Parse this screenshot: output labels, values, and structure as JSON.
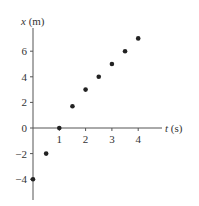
{
  "chart_data": {
    "type": "scatter",
    "title": "",
    "xlabel_var": "t",
    "xlabel_unit": "(s)",
    "ylabel_var": "x",
    "ylabel_unit": "(m)",
    "x_ticks": [
      "1",
      "2",
      "3",
      "4"
    ],
    "y_ticks": [
      "6",
      "4",
      "2",
      "0",
      "−2",
      "−4"
    ],
    "xlim": [
      0,
      5
    ],
    "ylim": [
      -5.5,
      7.5
    ],
    "grid": false,
    "legend": null,
    "points": [
      {
        "t": 0,
        "x": -4
      },
      {
        "t": 0.5,
        "x": -2
      },
      {
        "t": 1,
        "x": 0
      },
      {
        "t": 1.5,
        "x": 1.7
      },
      {
        "t": 2,
        "x": 3
      },
      {
        "t": 2.5,
        "x": 4
      },
      {
        "t": 3,
        "x": 5
      },
      {
        "t": 3.5,
        "x": 6
      },
      {
        "t": 4,
        "x": 7
      }
    ],
    "colors": {
      "axis": "#555555",
      "point": "#222222",
      "text": "#333333"
    }
  }
}
